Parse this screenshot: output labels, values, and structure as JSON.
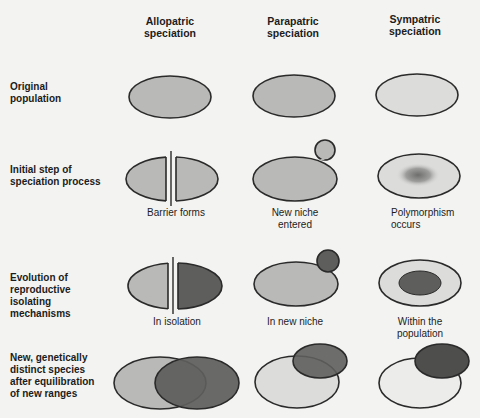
{
  "columns": [
    {
      "title": "Allopatric speciation",
      "line1": "Allopatric",
      "line2": "speciation"
    },
    {
      "title": "Parapatric speciation",
      "line1": "Parapatric",
      "line2": "speciation"
    },
    {
      "title": "Sympatric speciation",
      "line1": "Sympatric",
      "line2": "speciation"
    }
  ],
  "rows": [
    {
      "label_lines": [
        "Original",
        "population"
      ]
    },
    {
      "label_lines": [
        "Initial step of",
        "speciation process"
      ]
    },
    {
      "label_lines": [
        "Evolution of",
        "reproductive",
        "isolating mechanisms"
      ]
    },
    {
      "label_lines": [
        "New, genetically",
        "distinct species",
        "after equilibration",
        "of new ranges"
      ]
    }
  ],
  "captions": {
    "row2": {
      "allopatric": "Barrier forms",
      "parapatric_l1": "New niche",
      "parapatric_l2": "entered",
      "sympatric_l1": "Polymorphism",
      "sympatric_l2": "occurs"
    },
    "row3": {
      "allopatric": "In isolation",
      "parapatric": "In new niche",
      "sympatric_l1": "Within the",
      "sympatric_l2": "population"
    }
  },
  "colors": {
    "background": "#f3f3f1",
    "outline": "#2a2a2a",
    "medium_gray": "#b9b9b7",
    "light_gray": "#dcdcda",
    "dark_gray": "#5e5e5c",
    "text": "#1c1c1c"
  }
}
